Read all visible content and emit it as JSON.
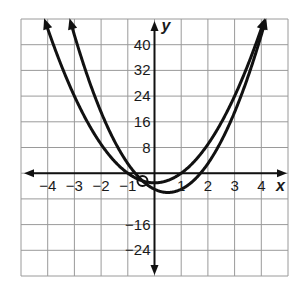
{
  "chart_data": {
    "type": "line",
    "title": "",
    "xlabel": "x",
    "ylabel": "y",
    "xlim": [
      -5,
      5
    ],
    "ylim": [
      -32,
      48
    ],
    "grid": true,
    "x_step": 1,
    "y_step": 8,
    "x_tick_labels": [
      "-4",
      "-3",
      "-2",
      "-1",
      "1",
      "2",
      "3",
      "4"
    ],
    "x_tick_values": [
      -4,
      -3,
      -2,
      -1,
      1,
      2,
      3,
      4
    ],
    "y_tick_labels": [
      "40",
      "32",
      "24",
      "16",
      "8",
      "-16",
      "-24"
    ],
    "y_tick_values": [
      40,
      32,
      24,
      16,
      8,
      -16,
      -24
    ],
    "series": [
      {
        "name": "shallow parabola",
        "expression": "3x^2 - 3",
        "x": [
          -4.12,
          -3,
          -2,
          -1,
          0,
          1,
          2,
          3,
          4.12
        ],
        "values": [
          48,
          24,
          9,
          0,
          -3,
          0,
          9,
          24,
          48
        ]
      },
      {
        "name": "steep parabola",
        "expression": "4x^2 - 4x - 5",
        "x": [
          -3.2,
          -3,
          -2,
          -1,
          0,
          0.5,
          1,
          2,
          3,
          4.2
        ],
        "values": [
          48,
          43,
          19,
          3,
          -5,
          -6,
          -5,
          3,
          19,
          48
        ]
      }
    ],
    "annotations": [
      {
        "type": "circle",
        "x": -0.45,
        "y": -2.4,
        "label": "intersection"
      }
    ]
  },
  "colors": {
    "curve": "#111111",
    "grid": "#9a9a9a",
    "axis": "#111111"
  }
}
